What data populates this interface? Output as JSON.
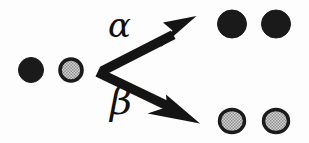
{
  "figure": {
    "name": "branching-reaction-diagram",
    "background_color": "#fdfdfd",
    "ink_color": "#141414",
    "width": 309,
    "height": 143
  },
  "labels": {
    "alpha": "α",
    "beta": "β"
  },
  "arrows": [
    {
      "id": "arrow-alpha",
      "label": "α",
      "from": [
        100,
        72
      ],
      "to": [
        196,
        22
      ],
      "direction": "up-right",
      "color": "#141414",
      "shaft_width": 9,
      "head_length": 34,
      "head_width": 30
    },
    {
      "id": "arrow-beta",
      "label": "β",
      "from": [
        100,
        72
      ],
      "to": [
        199,
        120
      ],
      "direction": "down-right",
      "color": "#141414",
      "shaft_width": 9,
      "head_length": 34,
      "head_width": 30
    }
  ],
  "particles": {
    "filled": {
      "style_name": "filled-circle",
      "fill": "#1a1a1a",
      "stroke": "#1a1a1a",
      "stroke_width": 1
    },
    "stippled": {
      "style_name": "stippled-circle",
      "fill": "#b9b9b9",
      "stroke": "#1a1a1a",
      "stroke_width": 3.5
    }
  },
  "groups": [
    {
      "id": "reactants",
      "name": "reactant-pair",
      "position": "left",
      "items": [
        {
          "id": "reactant-1",
          "type": "filled",
          "cx": 31,
          "cy": 70,
          "r": 12
        },
        {
          "id": "reactant-2",
          "type": "stippled",
          "cx": 71,
          "cy": 70,
          "r": 12
        }
      ]
    },
    {
      "id": "products-alpha",
      "name": "product-pair-alpha",
      "position": "top-right",
      "items": [
        {
          "id": "product-a1",
          "type": "filled",
          "cx": 232,
          "cy": 24,
          "r": 14
        },
        {
          "id": "product-a2",
          "type": "filled",
          "cx": 275,
          "cy": 24,
          "r": 14
        }
      ]
    },
    {
      "id": "products-beta",
      "name": "product-pair-beta",
      "position": "bottom-right",
      "items": [
        {
          "id": "product-b1",
          "type": "stippled",
          "cx": 232,
          "cy": 121,
          "r": 13
        },
        {
          "id": "product-b2",
          "type": "stippled",
          "cx": 275,
          "cy": 121,
          "r": 13
        }
      ]
    }
  ]
}
